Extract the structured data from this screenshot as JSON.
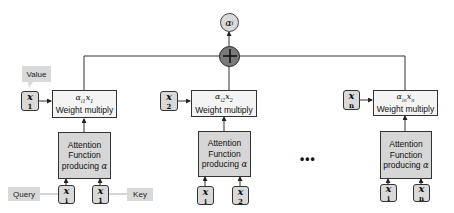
{
  "output": {
    "label": "α",
    "sub": "i"
  },
  "columns": [
    {
      "value_var": {
        "label": "x",
        "sub": "1"
      },
      "weight": {
        "formula": "α",
        "formula_sub": "i1",
        "formula_tail": "x",
        "formula_tail_sub": "1",
        "label": "Weight multiply"
      },
      "attention": {
        "line1": "Attention",
        "line2": "Function",
        "line3": "producing",
        "symbol": "α"
      },
      "query_var": {
        "label": "x",
        "sub": "i"
      },
      "key_var": {
        "label": "x",
        "sub": "1"
      }
    },
    {
      "value_var": {
        "label": "x",
        "sub": "2"
      },
      "weight": {
        "formula": "α",
        "formula_sub": "i2",
        "formula_tail": "x",
        "formula_tail_sub": "2",
        "label": "Weight multiply"
      },
      "attention": {
        "line1": "Attention",
        "line2": "Function",
        "line3": "producing",
        "symbol": "α"
      },
      "query_var": {
        "label": "x",
        "sub": "i"
      },
      "key_var": {
        "label": "x",
        "sub": "2"
      }
    },
    {
      "value_var": {
        "label": "x",
        "sub": "n"
      },
      "weight": {
        "formula": "α",
        "formula_sub": "in",
        "formula_tail": "x",
        "formula_tail_sub": "n",
        "label": "Weight multiply"
      },
      "attention": {
        "line1": "Attention",
        "line2": "Function",
        "line3": "producing",
        "symbol": "α"
      },
      "query_var": {
        "label": "x",
        "sub": "i"
      },
      "key_var": {
        "label": "x",
        "sub": "n"
      }
    }
  ],
  "callouts": {
    "value": "Value",
    "query": "Query",
    "key": "Key"
  },
  "ellipsis": "•••",
  "colors": {
    "node_fill": "#d9d9d9",
    "box_fill": "#f4f4f4",
    "att_fill": "#d6d6d6",
    "sum_fill": "#7a7a7a",
    "stroke": "#333333"
  }
}
